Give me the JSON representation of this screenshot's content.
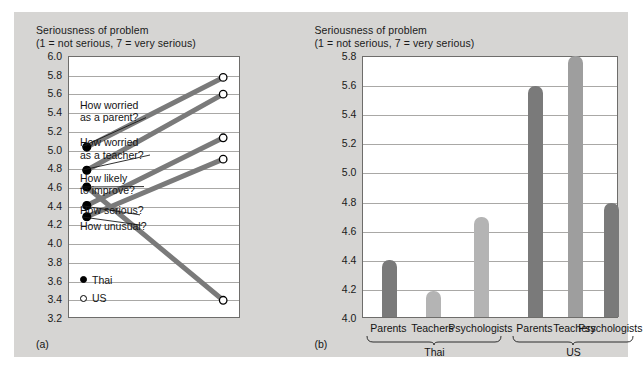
{
  "figure": {
    "background_color": "#d6d5d3",
    "plot_background": "#ffffff"
  },
  "panel_a": {
    "tag": "(a)",
    "title_line1": "Seriousness of problem",
    "title_line2": "(1 = not serious, 7 = very serious)",
    "legend": [
      {
        "marker": "filled-circle",
        "label": "Thai"
      },
      {
        "marker": "open-circle",
        "label": "US"
      }
    ],
    "y_ticks": [
      "6.0",
      "5.8",
      "5.6",
      "5.4",
      "5.2",
      "5.0",
      "4.8",
      "4.6",
      "4.4",
      "4.2",
      "4.0",
      "3.8",
      "3.6",
      "3.4",
      "3.2"
    ]
  },
  "panel_b": {
    "tag": "(b)",
    "title_line1": "Seriousness of problem",
    "title_line2": "(1 = not serious, 7 = very serious)",
    "y_ticks": [
      "5.8",
      "5.6",
      "5.4",
      "5.2",
      "5.0",
      "4.8",
      "4.6",
      "4.4",
      "4.2",
      "4.0"
    ],
    "group_labels": [
      "Thai",
      "US"
    ]
  },
  "chart_data": [
    {
      "type": "line",
      "title": "Seriousness of problem",
      "subtitle": "(1 = not serious, 7 = very serious)",
      "xlabel": "",
      "ylabel": "Seriousness of problem",
      "ylim": [
        3.2,
        6.0
      ],
      "ytick_step": 0.2,
      "grid": true,
      "legend": [
        "Thai",
        "US"
      ],
      "legend_position": "inside-bottom-left",
      "x": [
        "Thai",
        "US"
      ],
      "series": [
        {
          "name": "How worried as a parent?",
          "values": [
            5.03,
            5.78
          ]
        },
        {
          "name": "How worried as a teacher?",
          "values": [
            4.78,
            5.6
          ]
        },
        {
          "name": "How likely to improve?",
          "values": [
            4.6,
            3.38
          ]
        },
        {
          "name": "How serious?",
          "values": [
            4.4,
            5.13
          ]
        },
        {
          "name": "How unusual?",
          "values": [
            4.28,
            4.9
          ]
        }
      ],
      "line_color": "#7a7a7a",
      "marker_thai": "filled-circle",
      "marker_us": "open-circle"
    },
    {
      "type": "bar",
      "title": "Seriousness of problem",
      "subtitle": "(1 = not serious, 7 = very serious)",
      "xlabel": "",
      "ylabel": "Seriousness of problem",
      "ylim": [
        4.0,
        5.8
      ],
      "ytick_step": 0.2,
      "grid": true,
      "categories": [
        "Parents",
        "Teachers",
        "Psychologists",
        "Parents",
        "Teachers",
        "Psychologists"
      ],
      "groups": [
        "Thai",
        "Thai",
        "Thai",
        "US",
        "US",
        "US"
      ],
      "values": [
        4.39,
        4.18,
        4.69,
        5.59,
        5.79,
        4.78
      ],
      "bar_colors": [
        "#7a7a7a",
        "#b4b4b4",
        "#b4b4b4",
        "#7a7a7a",
        "#9e9e9e",
        "#7a7a7a"
      ]
    }
  ]
}
